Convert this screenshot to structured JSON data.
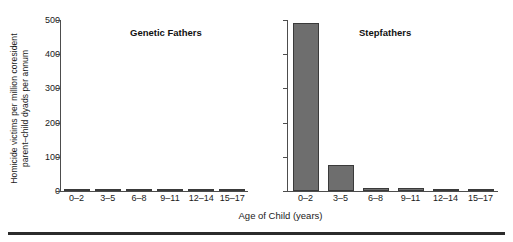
{
  "chart_data": {
    "type": "bar",
    "title": "",
    "xlabel": "Age of Child (years)",
    "ylabel": "Homicide victims per million coresident\nparent–child dyads per annum",
    "categories": [
      "0–2",
      "3–5",
      "6–8",
      "9–11",
      "12–14",
      "15–17"
    ],
    "ylim": [
      0,
      500
    ],
    "yticks": [
      0,
      100,
      200,
      300,
      400,
      500
    ],
    "ytick_labels": [
      "0",
      "100",
      "200",
      "300",
      "400",
      "500"
    ],
    "grid": false,
    "legend": "none",
    "panels": [
      {
        "title": "Genetic Fathers",
        "values": [
          6,
          5,
          3,
          3,
          2,
          2
        ],
        "y_axis_labeled": true
      },
      {
        "title": "Stepfathers",
        "values": [
          490,
          75,
          8,
          8,
          5,
          5
        ],
        "y_axis_labeled": false
      }
    ],
    "series": [
      {
        "name": "Genetic Fathers",
        "values": [
          6,
          5,
          3,
          3,
          2,
          2
        ]
      },
      {
        "name": "Stepfathers",
        "values": [
          490,
          75,
          8,
          8,
          5,
          5
        ]
      }
    ],
    "colors": {
      "bar_fill": "#6e6e6e",
      "bar_edge": "#3a3a3a",
      "axis": "#4d4d4d",
      "text": "#1a1a1a",
      "background": "#ffffff",
      "rule": "#2b2b2b"
    }
  }
}
